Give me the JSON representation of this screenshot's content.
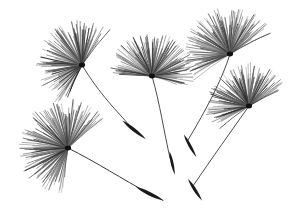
{
  "image": {
    "title": "Dandelion Seeds",
    "subject": "dandelion-seed-pappus-cluster",
    "background_color": "#ffffff",
    "ink_color": "#1a1a1a",
    "filament_color": "#555555",
    "width": 298,
    "height": 224,
    "alt_text": "Five black-and-white dandelion seed heads with radiating pappus filaments connected by thin curved stems to dark spindle-shaped seeds"
  },
  "scene": {
    "pappus_heads": [
      {
        "name": "pappus-head-upper-left",
        "cx": 82,
        "cy": 65,
        "radius": 44,
        "angle_start": 118,
        "angle_end": 300,
        "filaments": 150,
        "core_color": "#111111"
      },
      {
        "name": "pappus-head-upper-center",
        "cx": 152,
        "cy": 76,
        "radius": 42,
        "angle_start": 182,
        "angle_end": 372,
        "filaments": 150,
        "core_color": "#111111"
      },
      {
        "name": "pappus-head-upper-right",
        "cx": 230,
        "cy": 54,
        "radius": 45,
        "angle_start": 150,
        "angle_end": 330,
        "filaments": 150,
        "core_color": "#111111"
      },
      {
        "name": "pappus-head-right",
        "cx": 249,
        "cy": 106,
        "radius": 42,
        "angle_start": 150,
        "angle_end": 330,
        "filaments": 140,
        "core_color": "#111111"
      },
      {
        "name": "pappus-head-lower-left",
        "cx": 68,
        "cy": 148,
        "radius": 48,
        "angle_start": 100,
        "angle_end": 320,
        "filaments": 160,
        "core_color": "#111111"
      }
    ],
    "stems": [
      {
        "name": "stem-upper-left",
        "path": "M82,65 C 100,95 118,112 130,126",
        "width": 0.9
      },
      {
        "name": "stem-upper-center",
        "path": "M152,76 C 160,104 164,132 170,158",
        "width": 0.9
      },
      {
        "name": "stem-upper-right",
        "path": "M230,54 C 222,80 206,110 188,140",
        "width": 0.9
      },
      {
        "name": "stem-right",
        "path": "M249,106 C 232,130 212,158 193,186",
        "width": 0.9
      },
      {
        "name": "stem-lower-left",
        "path": "M68,148 C 96,162 124,180 148,193",
        "width": 1.0
      }
    ],
    "achenes": [
      {
        "name": "achene-upper-left",
        "cx": 134,
        "cy": 130,
        "len": 30,
        "w": 4.4,
        "rot": 39
      },
      {
        "name": "achene-upper-center",
        "cx": 172,
        "cy": 163,
        "len": 24,
        "w": 3.6,
        "rot": 78
      },
      {
        "name": "achene-upper-right",
        "cx": 190,
        "cy": 146,
        "len": 26,
        "w": 3.8,
        "rot": 62
      },
      {
        "name": "achene-right",
        "cx": 195,
        "cy": 190,
        "len": 26,
        "w": 4.0,
        "rot": 58
      },
      {
        "name": "achene-lower-left",
        "cx": 150,
        "cy": 194,
        "len": 32,
        "w": 4.6,
        "rot": 27
      }
    ]
  }
}
